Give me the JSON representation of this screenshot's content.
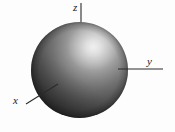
{
  "figure": {
    "background_color": "#fdfdfd",
    "axes": [
      {
        "id": "z",
        "label": "z",
        "orientation": "vertical-up",
        "line": {
          "x1": 81,
          "y1": 3,
          "x2": 81,
          "y2": 25
        },
        "label_position": {
          "x": 73,
          "y": 2
        },
        "color": "#2b2b2b"
      },
      {
        "id": "y",
        "label": "y",
        "orientation": "horizontal-right",
        "line": {
          "x1": 118,
          "y1": 69,
          "x2": 163,
          "y2": 69
        },
        "label_position": {
          "x": 147,
          "y": 56
        },
        "color": "#2b2b2b"
      },
      {
        "id": "x",
        "label": "x",
        "orientation": "diagonal-down-left",
        "line": {
          "x1": 58,
          "y1": 84,
          "x2": 26,
          "y2": 104
        },
        "label_position": {
          "x": 13,
          "y": 95
        },
        "color": "#2b2b2b"
      }
    ],
    "sphere": {
      "center": {
        "x": 79.5,
        "y": 70
      },
      "radius_x": 48,
      "radius_y": 48,
      "bounds": {
        "left": 31,
        "top": 22,
        "right": 128,
        "bottom": 118
      },
      "fill_base_color": "#5c5c5c",
      "shadow_color": "#232323",
      "highlight_color": "#dcdcdc",
      "highlight_position": {
        "x": 93,
        "y": 47
      },
      "rim_color": "#3a3a3a",
      "shading": "radial-specular"
    }
  }
}
